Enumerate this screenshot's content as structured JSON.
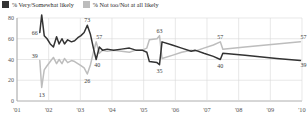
{
  "legend": {
    "items": [
      {
        "label": "% Very/Somewhat likely",
        "color": "#333333",
        "icon": "square-swatch-dark"
      },
      {
        "label": "% Not too/Not at all likely",
        "color": "#bdbdbd",
        "icon": "square-swatch-gray"
      }
    ]
  },
  "chart_data": {
    "type": "line",
    "title": "",
    "subtitle": "",
    "xlabel": "",
    "ylabel": "",
    "xlim": [
      2001,
      2010
    ],
    "ylim": [
      0,
      80
    ],
    "yticks": [
      0,
      20,
      40,
      60,
      80
    ],
    "xticks": [
      "'01",
      "'02",
      "'03",
      "'04",
      "'05",
      "'06",
      "'07",
      "'08",
      "'09",
      "'10"
    ],
    "grid": "horizontal-and-vertical-light",
    "legend_position": "top-left",
    "series": [
      {
        "name": "% Very/Somewhat likely",
        "color": "#333333",
        "points": [
          {
            "x": 2001.72,
            "y": 66
          },
          {
            "x": 2001.78,
            "y": 83
          },
          {
            "x": 2001.86,
            "y": 63
          },
          {
            "x": 2001.95,
            "y": 60
          },
          {
            "x": 2002.05,
            "y": 55
          },
          {
            "x": 2002.15,
            "y": 52
          },
          {
            "x": 2002.25,
            "y": 62
          },
          {
            "x": 2002.33,
            "y": 55
          },
          {
            "x": 2002.42,
            "y": 60
          },
          {
            "x": 2002.5,
            "y": 55
          },
          {
            "x": 2002.6,
            "y": 59
          },
          {
            "x": 2002.72,
            "y": 57
          },
          {
            "x": 2002.82,
            "y": 58
          },
          {
            "x": 2002.92,
            "y": 61
          },
          {
            "x": 2003.02,
            "y": 63
          },
          {
            "x": 2003.12,
            "y": 66
          },
          {
            "x": 2003.22,
            "y": 73
          },
          {
            "x": 2003.32,
            "y": 64
          },
          {
            "x": 2003.42,
            "y": 50
          },
          {
            "x": 2003.5,
            "y": 40
          },
          {
            "x": 2003.6,
            "y": 52
          },
          {
            "x": 2003.7,
            "y": 49
          },
          {
            "x": 2003.85,
            "y": 50
          },
          {
            "x": 2004.05,
            "y": 49
          },
          {
            "x": 2004.3,
            "y": 50
          },
          {
            "x": 2004.55,
            "y": 51
          },
          {
            "x": 2004.75,
            "y": 49
          },
          {
            "x": 2004.95,
            "y": 49
          },
          {
            "x": 2005.1,
            "y": 47
          },
          {
            "x": 2005.18,
            "y": 38
          },
          {
            "x": 2005.42,
            "y": 37
          },
          {
            "x": 2005.5,
            "y": 35
          },
          {
            "x": 2005.58,
            "y": 57
          },
          {
            "x": 2005.9,
            "y": 54
          },
          {
            "x": 2006.2,
            "y": 51
          },
          {
            "x": 2006.5,
            "y": 48
          },
          {
            "x": 2006.62,
            "y": 49
          },
          {
            "x": 2006.9,
            "y": 46
          },
          {
            "x": 2007.2,
            "y": 43
          },
          {
            "x": 2007.42,
            "y": 40
          },
          {
            "x": 2007.5,
            "y": 46
          },
          {
            "x": 2008.2,
            "y": 44
          },
          {
            "x": 2009.2,
            "y": 41
          },
          {
            "x": 2009.95,
            "y": 39
          }
        ],
        "labels": [
          {
            "text": "83",
            "x": 2001.78,
            "y": 83
          },
          {
            "text": "66",
            "x": 2001.72,
            "y": 66
          },
          {
            "text": "73",
            "x": 2003.22,
            "y": 73
          },
          {
            "text": "40",
            "x": 2003.5,
            "y": 40
          },
          {
            "text": "35",
            "x": 2005.5,
            "y": 35
          },
          {
            "text": "40",
            "x": 2007.42,
            "y": 40
          },
          {
            "text": "39",
            "x": 2009.95,
            "y": 39
          }
        ]
      },
      {
        "name": "% Not too/Not at all likely",
        "color": "#bdbdbd",
        "points": [
          {
            "x": 2001.72,
            "y": 39
          },
          {
            "x": 2001.78,
            "y": 13
          },
          {
            "x": 2001.86,
            "y": 30
          },
          {
            "x": 2001.95,
            "y": 34
          },
          {
            "x": 2002.05,
            "y": 38
          },
          {
            "x": 2002.15,
            "y": 42
          },
          {
            "x": 2002.25,
            "y": 36
          },
          {
            "x": 2002.33,
            "y": 40
          },
          {
            "x": 2002.42,
            "y": 36
          },
          {
            "x": 2002.5,
            "y": 41
          },
          {
            "x": 2002.6,
            "y": 37
          },
          {
            "x": 2002.72,
            "y": 39
          },
          {
            "x": 2002.82,
            "y": 38
          },
          {
            "x": 2002.92,
            "y": 36
          },
          {
            "x": 2003.02,
            "y": 34
          },
          {
            "x": 2003.12,
            "y": 32
          },
          {
            "x": 2003.22,
            "y": 26
          },
          {
            "x": 2003.32,
            "y": 35
          },
          {
            "x": 2003.42,
            "y": 48
          },
          {
            "x": 2003.5,
            "y": 57
          },
          {
            "x": 2003.6,
            "y": 46
          },
          {
            "x": 2003.7,
            "y": 49
          },
          {
            "x": 2003.85,
            "y": 48
          },
          {
            "x": 2004.05,
            "y": 49
          },
          {
            "x": 2004.3,
            "y": 48
          },
          {
            "x": 2004.55,
            "y": 47
          },
          {
            "x": 2004.75,
            "y": 49
          },
          {
            "x": 2004.95,
            "y": 49
          },
          {
            "x": 2005.1,
            "y": 51
          },
          {
            "x": 2005.18,
            "y": 59
          },
          {
            "x": 2005.42,
            "y": 60
          },
          {
            "x": 2005.5,
            "y": 63
          },
          {
            "x": 2005.58,
            "y": 41
          },
          {
            "x": 2005.9,
            "y": 44
          },
          {
            "x": 2006.2,
            "y": 47
          },
          {
            "x": 2006.5,
            "y": 49
          },
          {
            "x": 2006.62,
            "y": 48
          },
          {
            "x": 2006.9,
            "y": 51
          },
          {
            "x": 2007.2,
            "y": 54
          },
          {
            "x": 2007.42,
            "y": 57
          },
          {
            "x": 2007.5,
            "y": 50
          },
          {
            "x": 2008.2,
            "y": 52
          },
          {
            "x": 2009.2,
            "y": 55
          },
          {
            "x": 2009.95,
            "y": 57
          }
        ],
        "labels": [
          {
            "text": "39",
            "x": 2001.72,
            "y": 39
          },
          {
            "text": "13",
            "x": 2001.78,
            "y": 13
          },
          {
            "text": "26",
            "x": 2003.22,
            "y": 26
          },
          {
            "text": "57",
            "x": 2003.5,
            "y": 57
          },
          {
            "text": "63",
            "x": 2005.5,
            "y": 63
          },
          {
            "text": "57",
            "x": 2007.42,
            "y": 57
          },
          {
            "text": "57",
            "x": 2009.95,
            "y": 57
          }
        ]
      }
    ]
  },
  "axis": {
    "y_labels": [
      "80",
      "60",
      "40",
      "20",
      "0"
    ],
    "x_labels": [
      "'01",
      "'02",
      "'03",
      "'04",
      "'05",
      "'06",
      "'07",
      "'08",
      "'09",
      "'10"
    ]
  }
}
